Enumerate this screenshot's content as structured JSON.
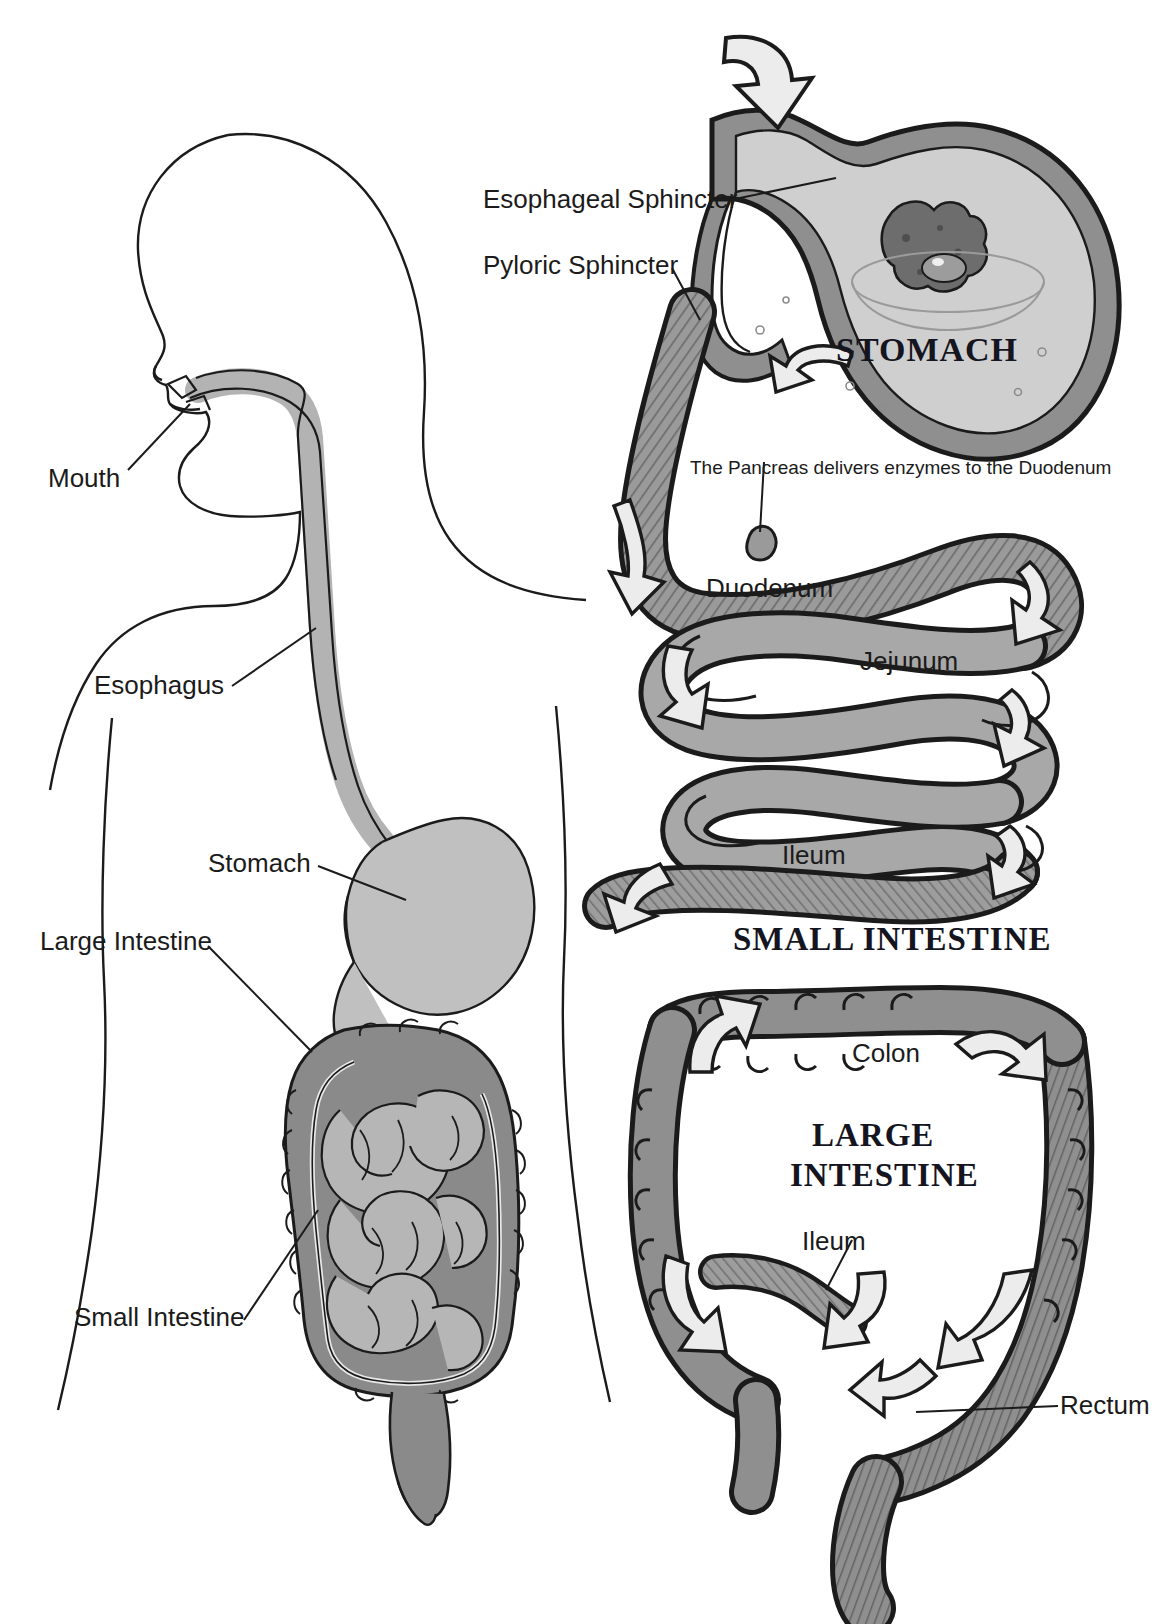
{
  "title": "THE DIGESTIVE SYSTEM",
  "colors": {
    "outline": "#1b1b1b",
    "organ_light": "#c9c9c9",
    "organ_mid": "#a8a8a8",
    "organ_dark": "#7d7d7d",
    "organ_darker": "#6a6a6a",
    "arrow_fill": "#e6e6e6",
    "background": "#ffffff",
    "text": "#1b1b1b"
  },
  "left_panel": {
    "name": "whole-body-digestive-tract",
    "labels": [
      {
        "id": "mouth",
        "text": "Mouth"
      },
      {
        "id": "esophagus",
        "text": "Esophagus"
      },
      {
        "id": "stomach",
        "text": "Stomach"
      },
      {
        "id": "large-intestine",
        "text": "Large Intestine"
      },
      {
        "id": "small-intestine",
        "text": "Small Intestine"
      }
    ]
  },
  "stomach_panel": {
    "heading": "STOMACH",
    "labels": [
      {
        "id": "esophageal-sphincter",
        "text": "Esophageal Sphincter"
      },
      {
        "id": "pyloric-sphincter",
        "text": "Pyloric Sphincter"
      }
    ]
  },
  "small_intestine_panel": {
    "heading": "SMALL INTESTINE",
    "note": "The Pancreas delivers enzymes to the Duodenum",
    "labels": [
      {
        "id": "duodenum",
        "text": "Duodenum"
      },
      {
        "id": "jejunum",
        "text": "Jejunum"
      },
      {
        "id": "ileum",
        "text": "Ileum"
      }
    ]
  },
  "large_intestine_panel": {
    "heading_line1": "LARGE",
    "heading_line2": "INTESTINE",
    "labels": [
      {
        "id": "colon",
        "text": "Colon"
      },
      {
        "id": "ileum",
        "text": "Ileum"
      },
      {
        "id": "rectum",
        "text": "Rectum"
      }
    ]
  }
}
